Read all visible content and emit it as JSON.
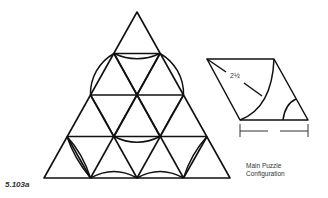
{
  "figure": {
    "label": "5.103a",
    "caption_line1": "Main Puzzle",
    "caption_line2": "Configuration",
    "dimension_label": "2½"
  },
  "colors": {
    "stroke": "#111111",
    "background": "#ffffff",
    "text": "#333333"
  },
  "main_triangle": {
    "apex": [
      137,
      12
    ],
    "base_left": [
      44,
      178
    ],
    "base_right": [
      230,
      178
    ],
    "subdivisions": 4
  },
  "piece": {
    "shape": "rhombus",
    "corners": [
      [
        207,
        59
      ],
      [
        274,
        59
      ],
      [
        308,
        120
      ],
      [
        240,
        120
      ]
    ]
  }
}
